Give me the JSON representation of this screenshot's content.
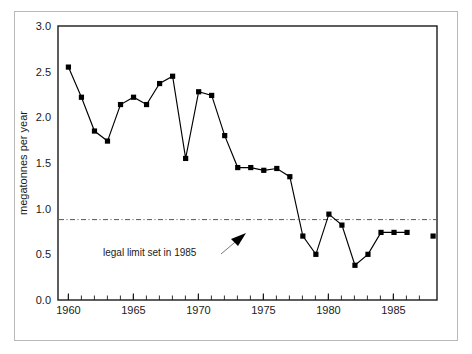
{
  "chart_data": {
    "type": "line",
    "title": "",
    "xlabel": "",
    "ylabel": "megatonnes per year",
    "xlim": [
      1959.2,
      1988.3
    ],
    "ylim": [
      0.0,
      3.0
    ],
    "grid": false,
    "legend": null,
    "x_ticks_major": [
      1960,
      1965,
      1970,
      1975,
      1980,
      1985
    ],
    "x_tick_labels": [
      "1960",
      "1965",
      "1970",
      "1975",
      "1980",
      "1985"
    ],
    "x_minor_tick_step": 1,
    "y_ticks": [
      0.0,
      0.5,
      1.0,
      1.5,
      2.0,
      2.5,
      3.0
    ],
    "y_tick_labels": [
      "0.0",
      "0.5",
      "1.0",
      "1.5",
      "2.0",
      "2.5",
      "3.0"
    ],
    "marker": "square",
    "marker_color": "#000000",
    "line_color": "#000000",
    "x": [
      1960,
      1961,
      1962,
      1963,
      1964,
      1965,
      1966,
      1967,
      1968,
      1969,
      1970,
      1971,
      1972,
      1973,
      1974,
      1975,
      1976,
      1977,
      1978,
      1979,
      1980,
      1981,
      1982,
      1983,
      1984,
      1985,
      1986,
      1988
    ],
    "values": [
      2.55,
      2.22,
      1.85,
      1.74,
      2.14,
      2.22,
      2.14,
      2.37,
      2.45,
      1.55,
      2.28,
      2.24,
      1.8,
      1.45,
      1.45,
      1.42,
      1.44,
      1.35,
      0.7,
      0.5,
      0.94,
      0.82,
      0.38,
      0.5,
      0.74,
      0.74,
      0.74,
      0.7
    ],
    "connected_through": 1986,
    "isolated_points": [
      1988
    ],
    "reference_line": {
      "label": "legal limit set in 1985",
      "value": 0.88,
      "style": "dash-dot",
      "color": "#555555"
    },
    "annotation": {
      "text": "legal limit set in 1985",
      "x": 1964.2,
      "y": 0.5,
      "arrow_from_x": 1969.4,
      "arrow_from_y": 0.56,
      "arrow_to_x": 1971.6,
      "arrow_to_y": 0.8
    }
  },
  "axes": {
    "y_axis_title": "megatonnes per year",
    "y_tick_labels": [
      "3.0",
      "2.5",
      "2.0",
      "1.5",
      "1.0",
      "0.5",
      "0.0"
    ],
    "x_tick_labels": [
      "1960",
      "1965",
      "1970",
      "1975",
      "1980",
      "1985"
    ]
  },
  "annotation": {
    "limit_label": "legal limit set in 1985"
  },
  "colors": {
    "line": "#000000",
    "marker": "#000000",
    "axis": "#1a1a1a",
    "reference_line": "#555555",
    "outer_border": "#b9b9b9",
    "background": "#ffffff"
  }
}
